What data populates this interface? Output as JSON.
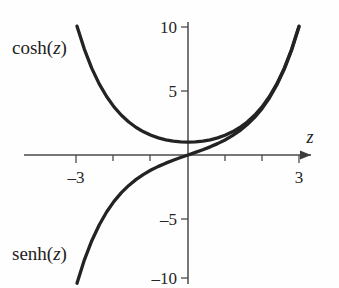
{
  "figure": {
    "background_color": "#fefefe",
    "curve_color": "#232323",
    "axis_color": "#4a4a4a",
    "text_color": "#222222"
  },
  "axes": {
    "x_axis_label": "z",
    "x_axis_label_italic": true,
    "y_axis_label": "",
    "origin_px": {
      "x": 188,
      "y": 155
    },
    "x_range": [
      -3.45,
      3.45
    ],
    "y_range": [
      -11.2,
      11.2
    ],
    "x_ticks": [
      -3,
      -2,
      -1,
      1,
      2,
      3
    ],
    "x_tick_labels": [
      {
        "value": -3,
        "text": "–3"
      },
      {
        "value": 3,
        "text": "3"
      }
    ],
    "y_ticks": [
      -10,
      -5,
      5,
      10
    ],
    "y_tick_labels": [
      {
        "value": 10,
        "text": "10"
      },
      {
        "value": 5,
        "text": "5"
      },
      {
        "value": -5,
        "text": "–5"
      },
      {
        "value": -10,
        "text": "–10"
      }
    ],
    "has_arrow_on_x_axis": true,
    "grid": false
  },
  "labels": {
    "cosh": {
      "text_prefix": "cosh(",
      "variable": "z",
      "text_suffix": ")"
    },
    "senh": {
      "text_prefix": "senh(",
      "variable": "z",
      "text_suffix": ")"
    }
  },
  "chart_data": {
    "type": "line",
    "title": "",
    "subtitle": "",
    "xlabel": "z",
    "ylabel": "",
    "xlim": [
      -3.45,
      3.45
    ],
    "ylim": [
      -11.2,
      11.2
    ],
    "grid": false,
    "legend_position": "inline-curve-labels",
    "x": [
      -3.0,
      -2.8,
      -2.6,
      -2.4,
      -2.2,
      -2.0,
      -1.8,
      -1.6,
      -1.4,
      -1.2,
      -1.0,
      -0.8,
      -0.6,
      -0.4,
      -0.2,
      0.0,
      0.2,
      0.4,
      0.6,
      0.8,
      1.0,
      1.2,
      1.4,
      1.6,
      1.8,
      2.0,
      2.2,
      2.4,
      2.6,
      2.8,
      3.0
    ],
    "series": [
      {
        "name": "cosh(z)",
        "label": "cosh(z)",
        "color": "#232323",
        "values": [
          10.068,
          8.253,
          6.769,
          5.557,
          4.568,
          3.762,
          3.107,
          2.577,
          2.151,
          1.811,
          1.543,
          1.337,
          1.185,
          1.081,
          1.02,
          1.0,
          1.02,
          1.081,
          1.185,
          1.337,
          1.543,
          1.811,
          2.151,
          2.577,
          3.107,
          3.762,
          4.568,
          5.557,
          6.769,
          8.253,
          10.068
        ]
      },
      {
        "name": "senh(z)",
        "label": "senh(z)",
        "color": "#232323",
        "values": [
          -10.018,
          -8.192,
          -6.695,
          -5.466,
          -4.457,
          -3.627,
          -2.942,
          -2.376,
          -1.904,
          -1.509,
          -1.175,
          -0.888,
          -0.637,
          -0.411,
          -0.201,
          0.0,
          0.201,
          0.411,
          0.637,
          0.888,
          1.175,
          1.509,
          1.904,
          2.376,
          2.942,
          3.627,
          4.457,
          5.466,
          6.695,
          8.192,
          10.018
        ]
      }
    ],
    "annotations": [
      {
        "text": "cosh(z)",
        "near_x": -3.1,
        "near_y": 8.2
      },
      {
        "text": "senh(z)",
        "near_x": -3.1,
        "near_y": -8.0
      }
    ]
  }
}
